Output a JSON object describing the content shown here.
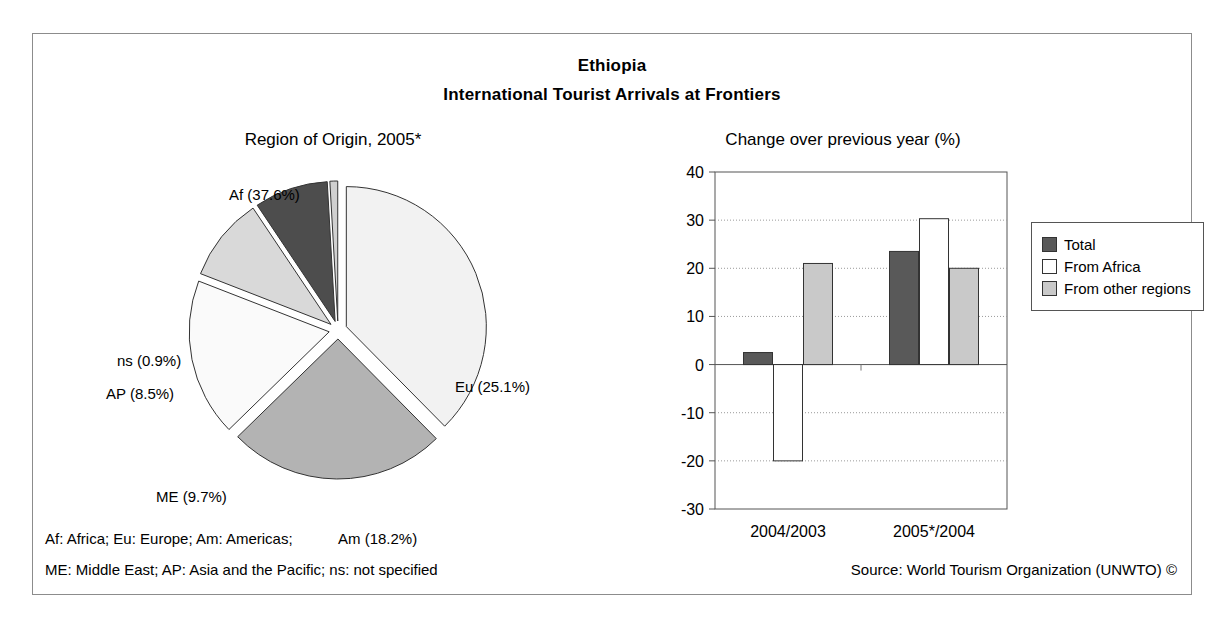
{
  "header": {
    "country": "Ethiopia",
    "subtitle": "International Tourist Arrivals at Frontiers"
  },
  "footnotes": {
    "line1": "Af: Africa; Eu: Europe; Am: Americas;",
    "line2": "ME: Middle East; AP: Asia and the Pacific; ns: not specified",
    "source": "Source: World Tourism Organization (UNWTO) ©"
  },
  "colors": {
    "total": "#595959",
    "from_africa": "#ffffff",
    "from_other_regions": "#c9c9c9",
    "pie_af": "#f2f2f2",
    "pie_eu": "#b3b3b3",
    "pie_am": "#fafafa",
    "pie_me": "#d9d9d9",
    "pie_ap": "#4d4d4d",
    "pie_ns": "#d0d0d0",
    "outline": "#333333",
    "frame": "#8c8c8c"
  },
  "chart_data": [
    {
      "type": "pie",
      "title": "Region of Origin, 2005*",
      "categories": [
        "Af",
        "Eu",
        "Am",
        "ME",
        "AP",
        "ns"
      ],
      "values": [
        37.6,
        25.1,
        18.2,
        9.7,
        8.5,
        0.9
      ],
      "labels": [
        "Af (37.6%)",
        "Eu (25.1%)",
        "Am (18.2%)",
        "ME (9.7%)",
        "AP (8.5%)",
        "ns (0.9%)"
      ],
      "unit": "%",
      "exploded": true,
      "legend": "none"
    },
    {
      "type": "bar",
      "title": "Change over previous year (%)",
      "categories": [
        "2004/2003",
        "2005*/2004"
      ],
      "series": [
        {
          "name": "Total",
          "values": [
            2.5,
            23.5
          ]
        },
        {
          "name": "From Africa",
          "values": [
            -20.0,
            30.3
          ]
        },
        {
          "name": "From other regions",
          "values": [
            21.0,
            20.0
          ]
        }
      ],
      "xlabel": "",
      "ylabel": "",
      "ylim": [
        -30,
        40
      ],
      "yticks": [
        40,
        30,
        20,
        10,
        0,
        -10,
        -20,
        -30
      ],
      "grid": true,
      "legend_position": "right"
    }
  ]
}
